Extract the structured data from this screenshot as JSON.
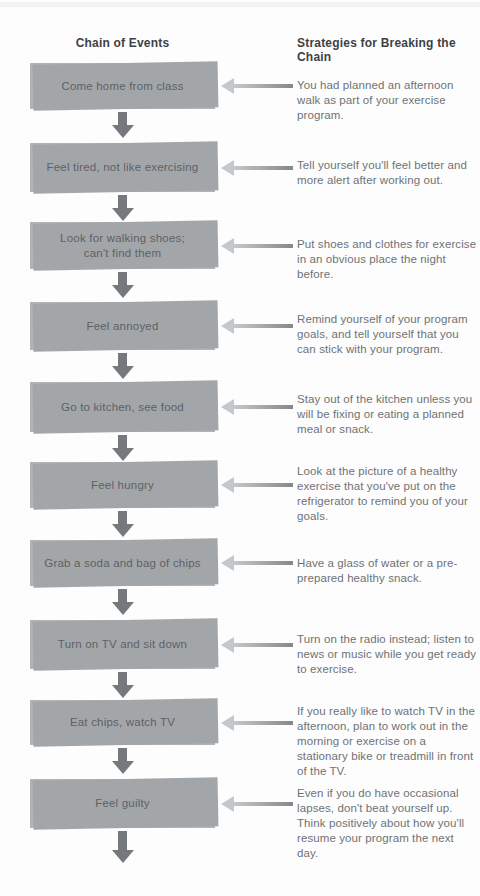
{
  "diagram": {
    "left_header": "Chain of Events",
    "right_header": "Strategies for Breaking the Chain",
    "rows": [
      {
        "event": "Come home from class",
        "strategy": "You had planned an afternoon walk as part of your exercise program."
      },
      {
        "event": "Feel tired, not like exercising",
        "strategy": "Tell yourself you'll feel better and more alert after working out."
      },
      {
        "event": "Look for walking shoes;\ncan't find them",
        "strategy": "Put shoes and clothes for exercise in an obvious place the night before."
      },
      {
        "event": "Feel annoyed",
        "strategy": "Remind yourself of your program goals, and tell yourself that you can stick with your program."
      },
      {
        "event": "Go to kitchen, see food",
        "strategy": "Stay out of the kitchen unless you will be fixing or eating a planned meal or snack."
      },
      {
        "event": "Feel hungry",
        "strategy": "Look at the picture of a healthy exercise that you've put on the refrigerator to remind you of your goals."
      },
      {
        "event": "Grab a soda and bag of chips",
        "strategy": "Have a glass of water or a pre-prepared healthy snack."
      },
      {
        "event": "Turn on TV and sit down",
        "strategy": "Turn on the radio instead; listen to news or music while you get ready to exercise."
      },
      {
        "event": "Eat chips, watch TV",
        "strategy": "If you really like to watch TV in the afternoon, plan to work out in the morning or exercise on a stationary bike or treadmill in front of the TV."
      },
      {
        "event": "Feel guilty",
        "strategy": "Even if you do have occasional lapses, don't beat yourself up. Think positively about how you'll resume your program the next day."
      }
    ],
    "icons": {
      "down_arrow": "down-arrow-icon",
      "left_arrow": "left-arrow-icon"
    },
    "colors": {
      "background": "#fdfdfd",
      "box_fill": "#b1b4b6",
      "box_shadow": "#a3a6a9",
      "box_text": "#5d6165",
      "down_arrow": "#75797d",
      "left_arrow_light": "#c5c8ca",
      "left_arrow_dark": "#84888b",
      "heading_text": "#3e4144",
      "strategy_text": "#6e7276"
    }
  }
}
